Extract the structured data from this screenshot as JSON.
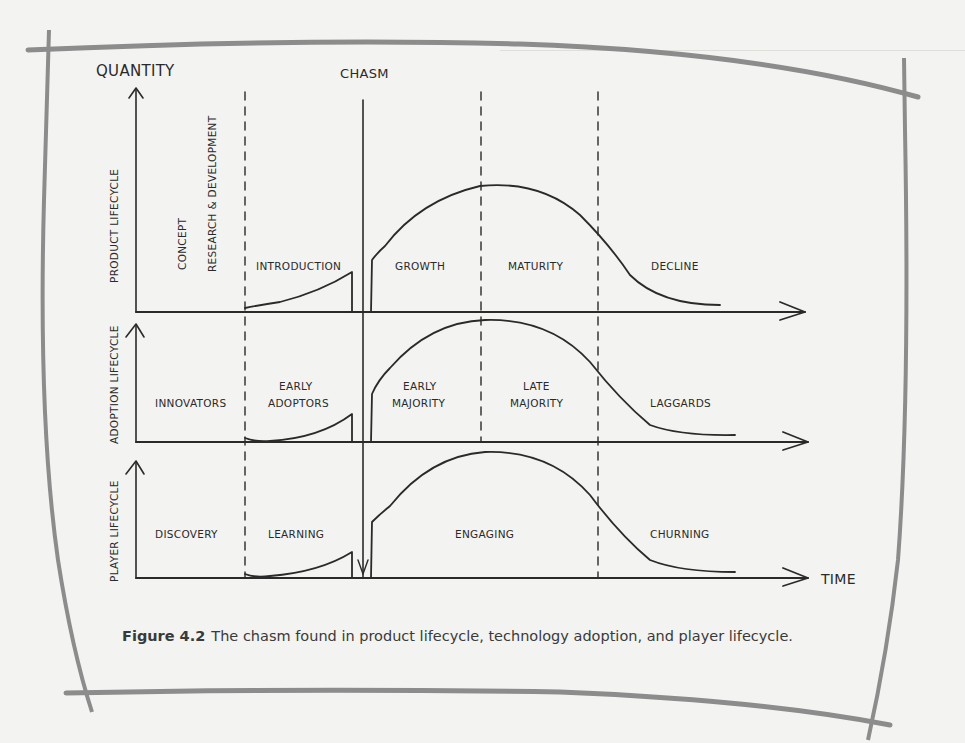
{
  "figure": {
    "y_axis_label": "QUANTITY",
    "x_axis_label": "TIME",
    "chasm_label": "CHASM",
    "rows": [
      {
        "name": "product",
        "row_label": "PRODUCT LIFECYCLE",
        "phases": [
          "CONCEPT",
          "RESEARCH & DEVELOPMENT",
          "INTRODUCTION",
          "GROWTH",
          "MATURITY",
          "DECLINE"
        ]
      },
      {
        "name": "adoption",
        "row_label": "ADOPTION LIFECYCLE",
        "phases": [
          "INNOVATORS",
          "EARLY",
          "ADOPTORS",
          "EARLY",
          "MAJORITY",
          "LATE",
          "MAJORITY",
          "LAGGARDS"
        ]
      },
      {
        "name": "player",
        "row_label": "PLAYER LIFECYCLE",
        "phases": [
          "DISCOVERY",
          "LEARNING",
          "ENGAGING",
          "CHURNING"
        ]
      }
    ]
  },
  "caption": {
    "label": "Figure 4.2",
    "text": "The chasm found in product lifecycle, technology adoption, and player lifecycle."
  },
  "colors": {
    "ink": "#2a2a2a",
    "page": "#f3f3f1",
    "frame": "#8a8a8a"
  }
}
